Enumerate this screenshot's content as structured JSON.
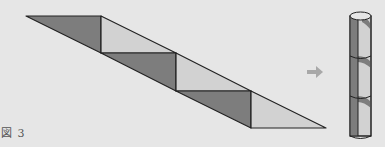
{
  "figure": {
    "caption": "図 3",
    "arrow": "⇒",
    "colors": {
      "background": "#e6e6e6",
      "dark": "#7d7d7d",
      "light": "#d2d2d2",
      "stroke": "#222222",
      "arrow": "#a8a8a8"
    },
    "strip": {
      "bands": 3,
      "description": "Parallelogram strip of alternating dark and light triangles"
    },
    "cylinder": {
      "segments": 3,
      "description": "Strip wrapped around cylinder forming helical pattern"
    }
  }
}
